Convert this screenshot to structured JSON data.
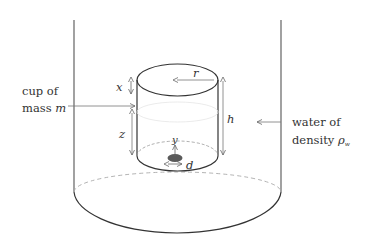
{
  "diagram": {
    "labels": {
      "cup_line1": "cup of",
      "cup_line2": "mass ",
      "cup_mass_var": "m",
      "water_line1": "water of",
      "water_line2": "density ",
      "water_density_var": "ρ",
      "water_density_sub": "w"
    },
    "variables": {
      "x": "x",
      "r": "r",
      "h": "h",
      "z": "z",
      "y": "y",
      "d": "d"
    },
    "colors": {
      "stroke": "#333333",
      "arrow": "#777777",
      "dashed": "#9a9a9a",
      "hole": "#5a5a5a"
    }
  }
}
